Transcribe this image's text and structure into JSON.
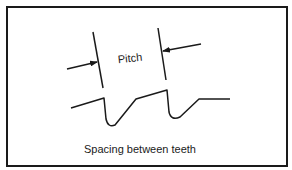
{
  "diagram": {
    "pitch_label": "Pitch",
    "caption": "Spacing between teeth",
    "line_color": "#1a1a1a",
    "background": "#ffffff"
  }
}
